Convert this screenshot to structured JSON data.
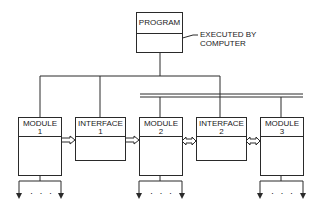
{
  "program": {
    "title": "PROGRAM"
  },
  "annotation": {
    "line1": "EXECUTED BY",
    "line2": "COMPUTER"
  },
  "modules": [
    {
      "name": "MODULE",
      "number": "1"
    },
    {
      "name": "INTERFACE",
      "number": "1"
    },
    {
      "name": "MODULE",
      "number": "2"
    },
    {
      "name": "INTERFACE",
      "number": "2"
    },
    {
      "name": "MODULE",
      "number": "3"
    }
  ],
  "continuation": "· · ·",
  "colors": {
    "line": "#2a2a2a",
    "background": "#ffffff"
  }
}
